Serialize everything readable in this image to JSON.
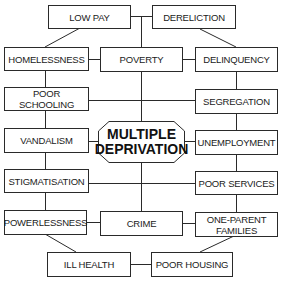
{
  "diagram": {
    "title": "Multiple Deprivation",
    "center": {
      "line1": "MULTIPLE",
      "line2": "DEPRIVATION"
    },
    "nodes": {
      "low_pay": "LOW PAY",
      "dereliction": "DERELICTION",
      "homelessness": "HOMELESSNESS",
      "poverty": "POVERTY",
      "delinquency": "DELINQUENCY",
      "poor_schooling_1": "POOR",
      "poor_schooling_2": "SCHOOLING",
      "segregation": "SEGREGATION",
      "vandalism": "VANDALISM",
      "unemployment": "UNEMPLOYMENT",
      "stigmatisation": "STIGMATISATION",
      "poor_services": "POOR SERVICES",
      "powerlessness": "POWERLESSNESS",
      "crime": "CRIME",
      "one_parent_1": "ONE-PARENT",
      "one_parent_2": "FAMILIES",
      "ill_health": "ILL HEALTH",
      "poor_housing": "POOR HOUSING"
    },
    "colors": {
      "line": "#2a2a2a",
      "text": "#1a1a1a",
      "background": "#ffffff"
    }
  }
}
